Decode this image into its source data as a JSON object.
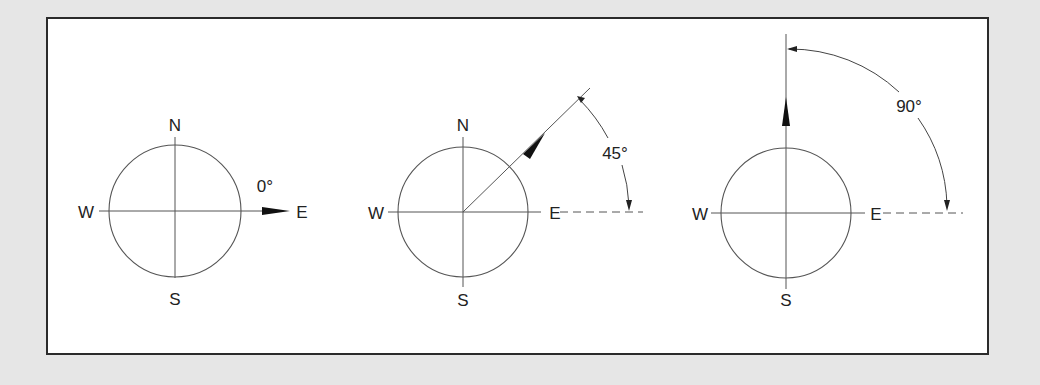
{
  "colors": {
    "background": "#e6e6e6",
    "panel": "#ffffff",
    "frame": "#2b2b2b",
    "line": "#555555",
    "text": "#222222"
  },
  "compasses": [
    {
      "id": "compass-0",
      "center": [
        175,
        211
      ],
      "radius": 66,
      "labels": {
        "north": "N",
        "south": "S",
        "east": "E",
        "west": "W"
      },
      "angle_label": "0°",
      "bearing_degrees": 0
    },
    {
      "id": "compass-45",
      "center": [
        463,
        212
      ],
      "radius": 65,
      "labels": {
        "north": "N",
        "south": "S",
        "east": "E",
        "west": "W"
      },
      "angle_label": "45°",
      "bearing_degrees": 45
    },
    {
      "id": "compass-90",
      "center": [
        786,
        213
      ],
      "radius": 65,
      "labels": {
        "north": "",
        "south": "S",
        "east": "E",
        "west": "W"
      },
      "angle_label": "90°",
      "bearing_degrees": 90
    }
  ]
}
